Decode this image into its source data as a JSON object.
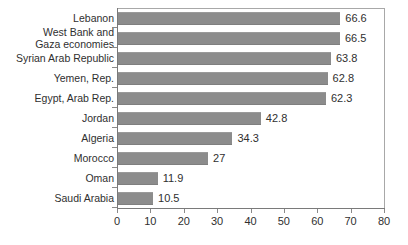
{
  "chart_data": {
    "type": "bar",
    "orientation": "horizontal",
    "title": "",
    "subtitle": "",
    "xlabel": "",
    "ylabel": "",
    "xlim": [
      0,
      80
    ],
    "xticks": [
      0,
      10,
      20,
      30,
      40,
      50,
      60,
      70,
      80
    ],
    "grid": false,
    "legend": null,
    "categories": [
      "Lebanon",
      "West Bank and Gaza economies",
      "Syrian Arab Republic",
      "Yemen, Rep.",
      "Egypt, Arab Rep.",
      "Jordan",
      "Algeria",
      "Morocco",
      "Oman",
      "Saudi Arabia"
    ],
    "values": [
      66.6,
      66.5,
      63.8,
      62.8,
      62.3,
      42.8,
      34.3,
      27,
      11.9,
      10.5
    ],
    "value_labels": [
      "66.6",
      "66.5",
      "63.8",
      "62.8",
      "62.3",
      "42.8",
      "34.3",
      "27",
      "11.9",
      "10.5"
    ],
    "category_lines": [
      [
        "Lebanon"
      ],
      [
        "West Bank and",
        "Gaza economies"
      ],
      [
        "Syrian Arab Republic"
      ],
      [
        "Yemen, Rep."
      ],
      [
        "Egypt, Arab Rep."
      ],
      [
        "Jordan"
      ],
      [
        "Algeria"
      ],
      [
        "Morocco"
      ],
      [
        "Oman"
      ],
      [
        "Saudi Arabia"
      ]
    ],
    "colors": {
      "bar": "#8c8c8c",
      "axis": "#7a7a7a",
      "frame": "#a8a8a8",
      "text": "#2f2f2f",
      "background": "#ffffff"
    }
  }
}
